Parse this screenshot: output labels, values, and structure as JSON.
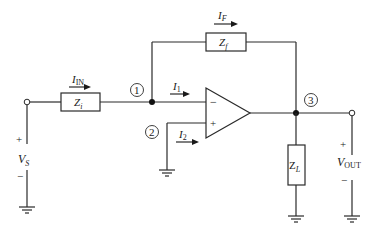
{
  "diagram": {
    "type": "inverting op-amp circuit (general impedance form)",
    "components": {
      "input_impedance": {
        "symbol": "Z",
        "subscript": "i"
      },
      "feedback_impedance": {
        "symbol": "Z",
        "subscript": "f"
      },
      "load_impedance": {
        "symbol": "Z",
        "subscript": "L"
      }
    },
    "currents": {
      "input": {
        "symbol": "I",
        "subscript": "IN"
      },
      "feedback": {
        "symbol": "I",
        "subscript": "F"
      },
      "inverting_input": {
        "symbol": "I",
        "subscript": "1"
      },
      "noninverting_input": {
        "symbol": "I",
        "subscript": "2"
      }
    },
    "nodes": {
      "n1": "1",
      "n2": "2",
      "n3": "3"
    },
    "sources": {
      "input_voltage": {
        "symbol": "V",
        "subscript": "S",
        "plus": "+",
        "minus": "−"
      },
      "output_voltage": {
        "symbol": "V",
        "subscript": "OUT",
        "plus": "+",
        "minus": "−"
      }
    },
    "opamp": {
      "minus_sign": "−",
      "plus_sign": "+"
    }
  }
}
